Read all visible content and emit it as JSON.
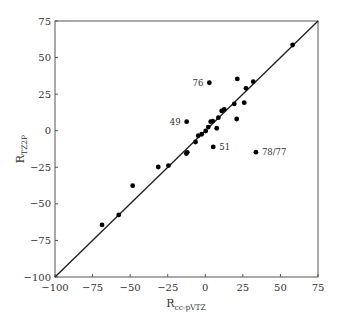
{
  "chart_data": {
    "type": "scatter",
    "title": "",
    "xlabel": {
      "main": "R",
      "sub": "cc-pVTZ"
    },
    "ylabel": {
      "main": "R",
      "sub": "TZ2P"
    },
    "xlim": [
      -100,
      75
    ],
    "ylim": [
      -100,
      75
    ],
    "xticks": [
      -100,
      -75,
      -50,
      -25,
      0,
      25,
      50,
      75
    ],
    "yticks": [
      -100,
      -75,
      -50,
      -25,
      0,
      25,
      50,
      75
    ],
    "xtick_labels": [
      "−100",
      "−75",
      "−50",
      "−25",
      "0",
      "25",
      "50",
      "75"
    ],
    "ytick_labels": [
      "−100",
      "−75",
      "−50",
      "−25",
      "0",
      "25",
      "50",
      "75"
    ],
    "grid": false,
    "reference_line": {
      "type": "y=x",
      "from": [
        -100,
        -100
      ],
      "to": [
        75,
        75
      ]
    },
    "marker_color": "#000000",
    "points": [
      {
        "x": -68.7,
        "y": -64.4
      },
      {
        "x": -57.6,
        "y": -57.6
      },
      {
        "x": -48.3,
        "y": -37.6
      },
      {
        "x": -31.3,
        "y": -24.8
      },
      {
        "x": -24.5,
        "y": -23.8
      },
      {
        "x": -12.6,
        "y": -15.6
      },
      {
        "x": -12.0,
        "y": -14.8
      },
      {
        "x": -12.4,
        "y": 6.2,
        "label": "49"
      },
      {
        "x": -6.5,
        "y": -7.7
      },
      {
        "x": -4.7,
        "y": -3.4
      },
      {
        "x": -2.4,
        "y": -2.4
      },
      {
        "x": 0.3,
        "y": -0.2
      },
      {
        "x": 2.0,
        "y": 2.5
      },
      {
        "x": 3.6,
        "y": 6.2
      },
      {
        "x": 4.9,
        "y": 6.6
      },
      {
        "x": 7.6,
        "y": 1.7
      },
      {
        "x": 8.7,
        "y": 8.9
      },
      {
        "x": 10.9,
        "y": 13.5
      },
      {
        "x": 12.6,
        "y": 14.6
      },
      {
        "x": 19.3,
        "y": 18.3
      },
      {
        "x": 20.9,
        "y": 8.0
      },
      {
        "x": 25.9,
        "y": 19.2
      },
      {
        "x": 27.1,
        "y": 29.0
      },
      {
        "x": 31.9,
        "y": 33.5
      },
      {
        "x": 21.3,
        "y": 35.4
      },
      {
        "x": 2.7,
        "y": 32.8,
        "label": "76"
      },
      {
        "x": 5.3,
        "y": -11.1,
        "label": "51"
      },
      {
        "x": 33.7,
        "y": -14.7,
        "label": "78/77"
      },
      {
        "x": 58.1,
        "y": 58.6
      }
    ],
    "annotations": [
      {
        "text": "49",
        "x": -12.4,
        "y": 6.2,
        "side": "left"
      },
      {
        "text": "76",
        "x": 2.7,
        "y": 32.8,
        "side": "left"
      },
      {
        "text": "51",
        "x": 5.3,
        "y": -11.1,
        "side": "right"
      },
      {
        "text": "78/77",
        "x": 33.7,
        "y": -14.7,
        "side": "right"
      }
    ]
  }
}
